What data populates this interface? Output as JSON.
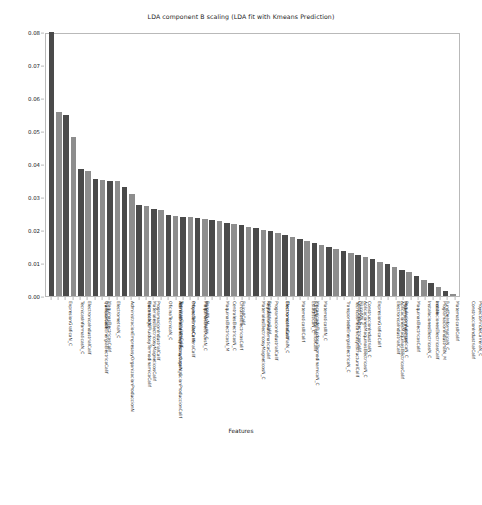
{
  "figure": {
    "title": "LDA component B scaling (LDA fit with Kmeans Prediction)",
    "xlabel": "Features",
    "ylabel": "Score"
  },
  "axis": {
    "yticks": [
      "0.00",
      "0.01",
      "0.02",
      "0.03",
      "0.04",
      "0.05",
      "0.06",
      "0.07",
      "0.08"
    ]
  },
  "colors": {
    "bar_dark": "#4a4a4a",
    "bar_light": "#8d8d8d",
    "frame": "#b9b9b9",
    "text": "#1a1a1a",
    "background": "#ffffff"
  },
  "chart_data": {
    "type": "bar",
    "title": "LDA component B scaling (LDA fit with Kmeans Prediction)",
    "xlabel": "Features",
    "ylabel": "Score",
    "ylim": [
      0.0,
      0.08
    ],
    "yticks": [
      0.0,
      0.01,
      0.02,
      0.03,
      0.04,
      0.05,
      0.06,
      0.07,
      0.08
    ],
    "grid": false,
    "legend": null,
    "categories": [
      "ExpresionGraficaN_C",
      "TecnicasInformaticasN_C",
      "ElectronicaIndustrialCalif",
      "TransportedeEnergiaElectricaCalif",
      "AdministracionEmpresasyOrganizacionProduccionN",
      "MaquinasElectricasCalif",
      "QuimicaCalif",
      "ElectrometriaN_C",
      "MecanicadeFluidosyTermodinamicaCalif",
      "MaterialesElectricosyMagneticosCalif",
      "AdministracionEmpresasyOrganizacionProduccionCalif",
      "ProgramacionIndustrialCalif",
      "QuimicaN_C",
      "TecnicasMecanicasyEstructuralN_C",
      "OficinaTecnicaN_C",
      "TecnicasCircuitosCalif",
      "ProyectoFinDeCarreraCalif",
      "OficinaTecnicaCalif",
      "MaquinasElectricasN_C",
      "MatematicasIIN_C",
      "FisicaIIN_M",
      "MaquinasElectricasN_M",
      "CentralesElectricasN_C",
      "CircuitosElectricosCalif",
      "MaterialesElectricosyMagneticosN_C",
      "FisicaIICalif",
      "RegulacionAutomaticaCalif",
      "ProgramacionIndustrialCalif",
      "EstadisticaCalif",
      "ElectronicaIndustrialN_C",
      "ElectrometriaCalif",
      "MecanicadeFluidosyTermodinamicaN_C",
      "MatematicasIIICalif",
      "FundDeInformaticaCalif",
      "EstadisticaN_C",
      "MatematicasIIIN_C",
      "TransportedeEnergiaElectricaN_C",
      "TecnicasMecanicasyEstructuralCalif",
      "AplicacionesMaquinasElectricasN_C",
      "CentralesElectricasCalif",
      "ConstruccionIndustrialN_C",
      "FisicaIVN_C",
      "ExpresionGraficaCalif",
      "AplicacionesMaquinasElectricasCalif",
      "ElectronicaIndustrialCalif",
      "RegulacionAutomaticaN_C",
      "MatematicasIIICalif",
      "MaquinasElectricasCalif",
      "InstalacionesElectricasN_C",
      "InstalacionesElectricasCalif",
      "ProgramacionIndustrialN_M",
      "FundDeInformaticaN_C",
      "aceite",
      "MatematicasIICalif",
      "ConstruccionIndustrialCalif",
      "ProyectoFinDeCarreraN_C"
    ],
    "values": [
      0.08,
      0.0558,
      0.0548,
      0.0483,
      0.0386,
      0.0378,
      0.0356,
      0.0352,
      0.035,
      0.0348,
      0.033,
      0.031,
      0.0276,
      0.0272,
      0.0264,
      0.0262,
      0.0246,
      0.0243,
      0.024,
      0.0238,
      0.0236,
      0.0233,
      0.023,
      0.0226,
      0.0222,
      0.0218,
      0.0214,
      0.021,
      0.0206,
      0.0201,
      0.0196,
      0.019,
      0.0184,
      0.0178,
      0.0172,
      0.0166,
      0.016,
      0.0154,
      0.0148,
      0.0142,
      0.0136,
      0.013,
      0.0124,
      0.0118,
      0.0112,
      0.0104,
      0.0096,
      0.0088,
      0.008,
      0.0072,
      0.0062,
      0.005,
      0.0038,
      0.0026,
      0.0014,
      0.0006
    ]
  }
}
